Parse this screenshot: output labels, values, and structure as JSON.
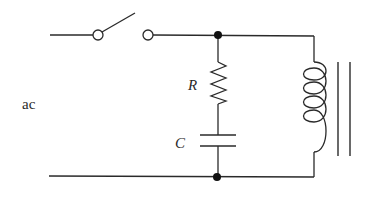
{
  "diagram": {
    "type": "circuit",
    "labels": {
      "source": "ac",
      "resistor": "R",
      "capacitor": "C"
    },
    "components": [
      {
        "name": "switch",
        "state": "open"
      },
      {
        "name": "resistor",
        "label": "R"
      },
      {
        "name": "capacitor",
        "label": "C"
      },
      {
        "name": "inductor",
        "core": "iron"
      }
    ],
    "colors": {
      "line": "#2a2a2a",
      "background": "#ffffff"
    }
  }
}
